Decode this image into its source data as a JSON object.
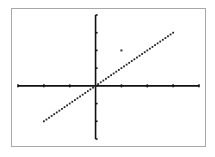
{
  "chart_data": {
    "type": "line",
    "title": "",
    "xlabel": "",
    "ylabel": "",
    "xlim": [
      -3,
      4
    ],
    "ylim": [
      -3,
      4
    ],
    "xscale_ticks": [
      -3,
      -2,
      -1,
      0,
      1,
      2,
      3,
      4
    ],
    "yscale_ticks": [
      -3,
      -2,
      -1,
      0,
      1,
      2,
      3,
      4
    ],
    "grid": false,
    "legend": "none",
    "series": [
      {
        "name": "y = x",
        "kind": "dotted-line",
        "x": [
          -2,
          3
        ],
        "y": [
          -2,
          3
        ],
        "color": "#222222"
      }
    ],
    "points": [
      {
        "name": "isolated-point",
        "x": 1,
        "y": 2,
        "color": "#333333"
      }
    ],
    "colors": {
      "axis": "#111111",
      "frame": "#a8a8a8",
      "background": "#ffffff"
    }
  }
}
